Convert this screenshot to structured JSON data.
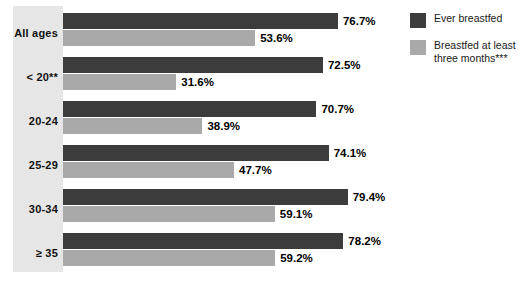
{
  "chart_data": {
    "type": "bar",
    "orientation": "horizontal",
    "title": "",
    "subtitle": "",
    "xlabel": "",
    "ylabel": "",
    "xlim": [
      0,
      100
    ],
    "grid": false,
    "legend_position": "right",
    "value_suffix": "%",
    "categories": [
      "All ages",
      "< 20**",
      "20-24",
      "25-29",
      "30-34",
      "≥ 35"
    ],
    "series": [
      {
        "name": "Ever breastfed",
        "color": "#3c3c3c",
        "values": [
          76.7,
          72.5,
          70.7,
          74.1,
          79.4,
          78.2
        ],
        "value_labels": [
          "76.7%",
          "72.5%",
          "70.7%",
          "74.1%",
          "79.4%",
          "78.2%"
        ]
      },
      {
        "name": "Breastfed at least\nthree months***",
        "color": "#a9a9a9",
        "values": [
          53.6,
          31.6,
          38.9,
          47.7,
          59.1,
          59.2
        ],
        "value_labels": [
          "53.6%",
          "31.6%",
          "38.9%",
          "47.7%",
          "59.1%",
          "59.2%"
        ]
      }
    ]
  },
  "legend": {
    "items": [
      {
        "label": "Ever breastfed",
        "color": "#3c3c3c"
      },
      {
        "label": "Breastfed at least\nthree months***",
        "color": "#a9a9a9"
      }
    ]
  },
  "colors": {
    "series_dark": "#3c3c3c",
    "series_light": "#a9a9a9",
    "label_panel": "#e6e6e6",
    "background": "#ffffff",
    "text": "#111111"
  }
}
